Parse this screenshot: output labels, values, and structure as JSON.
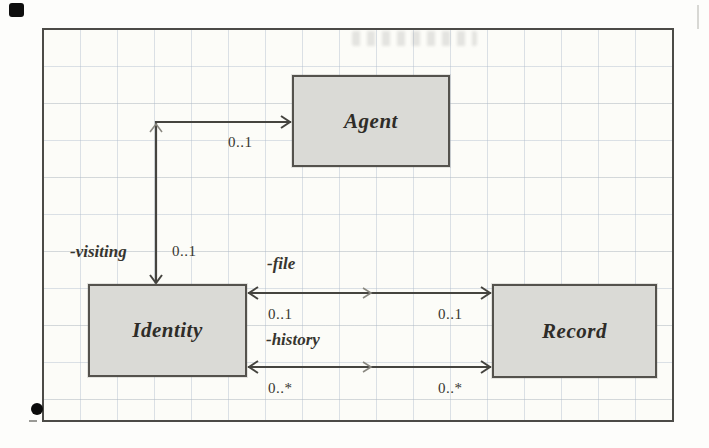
{
  "classes": {
    "agent": {
      "name": "Agent"
    },
    "identity": {
      "name": "Identity"
    },
    "record": {
      "name": "Record"
    }
  },
  "associations": {
    "identity_agent": {
      "role": "-visiting",
      "mult_identity": "0..1",
      "mult_agent": "0..1"
    },
    "file": {
      "role": "-file",
      "mult_identity": "0..1",
      "mult_record": "0..1"
    },
    "history": {
      "role": "-history",
      "mult_identity": "0..*",
      "mult_record": "0..*"
    }
  },
  "colors": {
    "box_fill": "#dadad6",
    "box_border": "#54524d",
    "connector_line": "#45443f",
    "grid_line": "#adbacb",
    "diagram_border": "#4c4b47",
    "text": "#37352f"
  }
}
